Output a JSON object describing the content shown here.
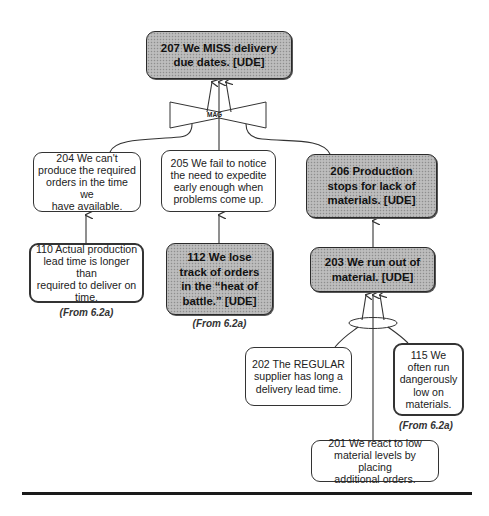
{
  "nodes": {
    "n207": {
      "text": "207  We MISS delivery\ndue dates.  [UDE]",
      "type": "UDE"
    },
    "n204": {
      "text": "204   We can't\nproduce the required\norders in the time we\nhave available.",
      "type": "entity"
    },
    "n205": {
      "text": "205  We fail to notice\nthe need to expedite\nearly enough when\nproblems come up.",
      "type": "entity"
    },
    "n206": {
      "text": "206  Production\nstops for lack of\nmaterials.  [UDE]",
      "type": "UDE"
    },
    "n110": {
      "text": "110  Actual production\nlead time is longer than\nrequired to deliver on\ntime.",
      "type": "entity",
      "source": "(From 6.2a)"
    },
    "n112": {
      "text": "112  We lose\ntrack of orders\nin the “heat of\nbattle.”  [UDE]",
      "type": "UDE",
      "source": "(From 6.2a)"
    },
    "n203": {
      "text": "203  We run out of\nmaterial.  [UDE]",
      "type": "UDE"
    },
    "n202": {
      "text": "202  The REGULAR\nsupplier has long a\ndelivery lead time.",
      "type": "entity"
    },
    "n115": {
      "text": "115  We\noften run\ndangerously\nlow on\nmaterials.",
      "type": "entity",
      "source": "(From 6.2a)"
    },
    "n201": {
      "text": "201  We react to low\nmaterial levels by placing\nadditional orders.",
      "type": "entity"
    }
  },
  "connectors": {
    "mag": {
      "label": "MAG"
    },
    "and_ellipse": {
      "label": ""
    }
  },
  "colors": {
    "ude_fill": "#b5b5b5",
    "line": "#333333"
  }
}
